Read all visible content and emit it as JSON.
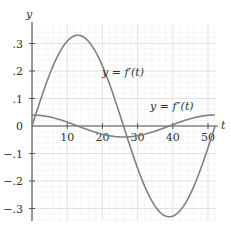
{
  "chart_data": {
    "type": "line",
    "title": "",
    "xlabel": "t",
    "ylabel": "y",
    "xlim": [
      0,
      52
    ],
    "ylim": [
      -0.35,
      0.37
    ],
    "grid": true,
    "x_ticks": [
      10,
      20,
      30,
      40,
      50
    ],
    "x_tick_labels": [
      "10",
      "20",
      "30",
      "40",
      "50"
    ],
    "y_ticks": [
      -0.3,
      -0.2,
      -0.1,
      0,
      0.1,
      0.2,
      0.3
    ],
    "y_tick_labels": [
      "−.3",
      "−.2",
      "−.1",
      "0",
      ".1",
      ".2",
      ".3"
    ],
    "series": [
      {
        "name": "y = f′(t)",
        "annotation": "y = f′(t)",
        "x": [
          0,
          4,
          8,
          12,
          13,
          16,
          20,
          24,
          26,
          28,
          32,
          36,
          39,
          40,
          44,
          48,
          52
        ],
        "values": [
          0,
          0.152,
          0.275,
          0.329,
          0.33,
          0.315,
          0.246,
          0.127,
          0,
          -0.04,
          -0.198,
          -0.3,
          -0.33,
          -0.329,
          -0.275,
          -0.152,
          0
        ]
      },
      {
        "name": "y = f″(t)",
        "annotation": "y = f″(t)",
        "x": [
          0,
          4,
          8,
          13,
          16,
          20,
          24,
          26,
          28,
          32,
          36,
          39,
          44,
          48,
          52
        ],
        "values": [
          0.04,
          0.035,
          0.022,
          0,
          -0.012,
          -0.027,
          -0.037,
          -0.04,
          -0.039,
          -0.03,
          -0.015,
          0,
          0.022,
          0.035,
          0.04
        ]
      }
    ],
    "color": "#808080"
  }
}
